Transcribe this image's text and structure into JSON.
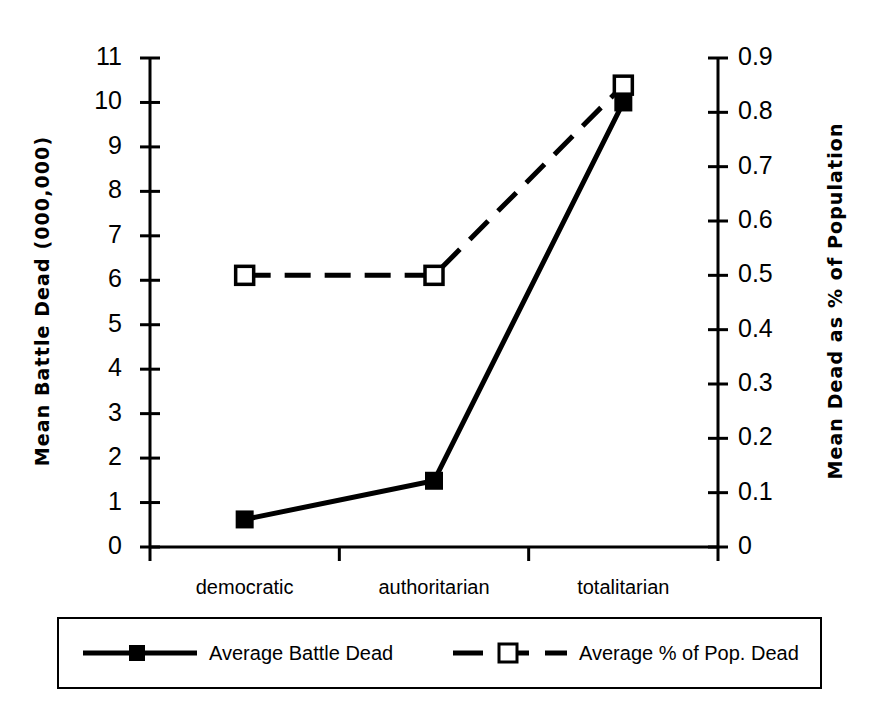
{
  "chart_data": {
    "type": "line",
    "title": "",
    "categories": [
      "democratic",
      "authoritarian",
      "totalitarian"
    ],
    "series": [
      {
        "name": "Average Battle Dead",
        "axis": "left",
        "marker": "filled-square",
        "line_style": "solid",
        "values": [
          0.62,
          1.49,
          10.0
        ]
      },
      {
        "name": "Average % of Pop. Dead",
        "axis": "right",
        "marker": "open-square",
        "line_style": "dashed",
        "values": [
          0.5,
          0.5,
          0.85
        ]
      }
    ],
    "left_axis": {
      "label": "Mean Battle Dead (000,000)",
      "ticks": [
        "11",
        "10",
        "9",
        "8",
        "7",
        "6",
        "5",
        "4",
        "3",
        "2",
        "1",
        "0"
      ],
      "min": 0,
      "max": 11
    },
    "right_axis": {
      "label": "Mean Dead as % of Population",
      "ticks": [
        "0.9",
        "0.8",
        "0.7",
        "0.6",
        "0.5",
        "0.4",
        "0.3",
        "0.2",
        "0.1",
        "0"
      ],
      "min": 0,
      "max": 0.9
    },
    "xlabel": "",
    "grid": false,
    "legend_position": "bottom",
    "colors": {
      "line": "#000000",
      "background": "#ffffff"
    }
  },
  "legend": {
    "entries": [
      {
        "label": "Average Battle Dead"
      },
      {
        "label": "Average % of Pop. Dead"
      }
    ]
  }
}
